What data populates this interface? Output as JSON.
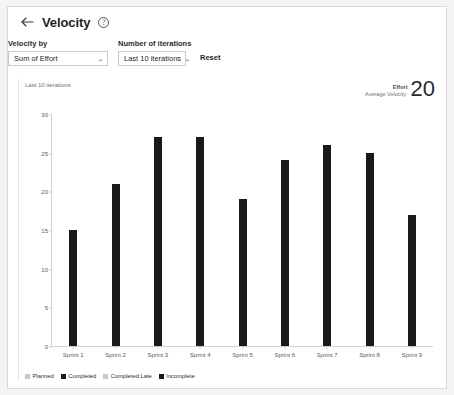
{
  "header": {
    "back_icon": "arrow-left-icon",
    "title": "Velocity",
    "help_icon": "help-circle-icon"
  },
  "filters": {
    "velocity_by": {
      "label": "Velocity by",
      "value": "Sum of Effort",
      "chevron": "⌄"
    },
    "iterations": {
      "label": "Number of iterations",
      "value": "Last 10 iterations",
      "chevron": "⌄"
    },
    "reset_label": "Reset"
  },
  "chart_card": {
    "subtitle": "Last 10 iterations",
    "summary": {
      "metric": "Effort",
      "caption": "Average Velocity:",
      "value": "20"
    }
  },
  "legend": {
    "items": [
      {
        "label": "Planned",
        "color": "#c8c8c8"
      },
      {
        "label": "Completed",
        "color": "#1a1a1a"
      },
      {
        "label": "Completed Late",
        "color": "#c8c8c8"
      },
      {
        "label": "Incomplete",
        "color": "#1a1a1a"
      }
    ]
  },
  "chart_data": {
    "type": "bar",
    "title": "Velocity",
    "subtitle": "Last 10 iterations",
    "xlabel": "",
    "ylabel": "",
    "categories": [
      "Sprint 1",
      "Sprint 2",
      "Sprint 3",
      "Sprint 4",
      "Sprint 5",
      "Sprint 6",
      "Sprint 7",
      "Sprint 8",
      "Sprint 9"
    ],
    "values": [
      15,
      21,
      27,
      27,
      19,
      24,
      26,
      25,
      17
    ],
    "series": [
      {
        "name": "Completed",
        "values": [
          15,
          21,
          27,
          27,
          19,
          24,
          26,
          25,
          17
        ]
      }
    ],
    "ylim": [
      0,
      30
    ],
    "yticks": [
      0,
      5,
      10,
      15,
      20,
      25,
      30
    ],
    "ytick_labels": [
      "0",
      "5",
      "10",
      "15",
      "20",
      "25",
      "30"
    ],
    "grid": false,
    "legend_position": "bottom-left",
    "bar_color": "#1a1a1a",
    "average_velocity": 20
  }
}
